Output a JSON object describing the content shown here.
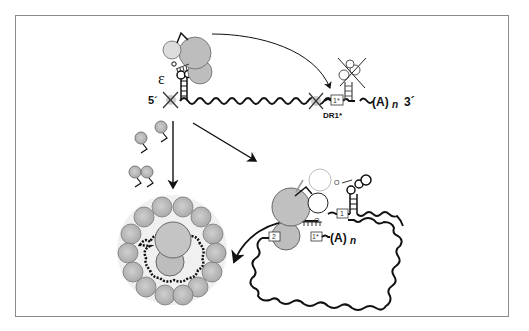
{
  "figure": {
    "top_panel": {
      "five_prime_label": "5´",
      "three_prime_label": "3´",
      "epsilon_label": "ε",
      "polyA_label": "(A)",
      "polyA_subscript": "n",
      "dr1_star_box_label": "1*",
      "dr1_star_caption": "DR1*"
    },
    "right_panel": {
      "box1_label": "1",
      "box2_label": "2",
      "box1star_label": "1*",
      "polyA_label": "(A)",
      "polyA_subscript": "n",
      "primer_o_label_top": "O",
      "primer_o_label_bottom": "O"
    },
    "left_panel": {
      "description": "capsid assembly around pgRNA-polymerase complex"
    },
    "colors": {
      "frame_border": "#8a8a8a",
      "polymerase_gray": "#bdbdbd",
      "light_gray": "#d9d9d9",
      "rna_line": "#111111",
      "capsid_gray": "#b8b8b8"
    },
    "icons": [
      "x-cross-icon",
      "arrow-icon",
      "stem-loop-icon",
      "wavy-rna-icon"
    ]
  }
}
